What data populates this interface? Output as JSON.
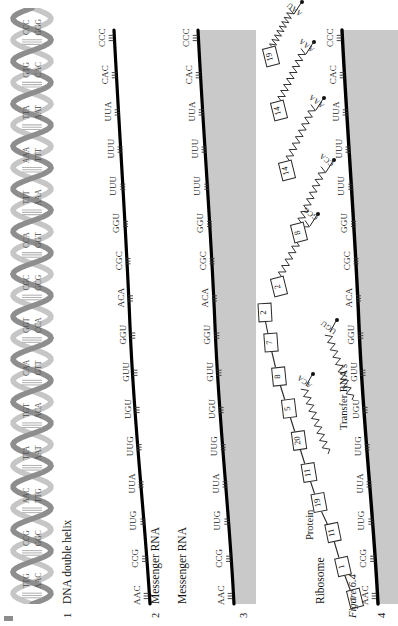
{
  "figure": {
    "caption": "Figure 6.4",
    "sections": [
      {
        "number": "1",
        "title": "DNA double helix"
      },
      {
        "number": "2",
        "title": "Messenger RNA"
      },
      {
        "number": "3",
        "title": "Messenger RNA"
      },
      {
        "number": "4",
        "title": "Ribosome"
      }
    ],
    "protein_label": "Protein",
    "trna_label": "Transfer RNA's"
  },
  "dna": {
    "top_strand": [
      "TTG",
      "CCG",
      "AAC",
      "TTA",
      "TGT",
      "CAA",
      "GGT",
      "CGC",
      "CCA",
      "TTT",
      "AAA",
      "TTA",
      "GTG",
      "CCC"
    ],
    "bottom_strand": [
      "AAC",
      "GGC",
      "TTG",
      "AAT",
      "ACA",
      "GTT",
      "CCA",
      "GCG",
      "GGT",
      "AAA",
      "TTT",
      "AAT",
      "CAC",
      "GGG"
    ],
    "helix_color_front": "#8e8e8e",
    "helix_color_back": "#c6c6c6",
    "rung_color": "#b5b5b5"
  },
  "mrna": {
    "codons": [
      "AAC",
      "CCG",
      "UUG",
      "UUA",
      "UUG",
      "UGU",
      "GUU",
      "GGU",
      "ACA",
      "CGC",
      "GGU",
      "UUU",
      "UUU",
      "UUA",
      "CAC",
      "CCC"
    ],
    "strand_color": "#000000"
  },
  "ribosome": {
    "codons": [
      "AAC",
      "CCG",
      "UUG",
      "UUA",
      "UUG",
      "UGU",
      "GUU",
      "GGU",
      "ACA",
      "CGC",
      "GGU",
      "UUU",
      "UUU",
      "UUA",
      "CAC",
      "CCC"
    ],
    "band_color": "#c9c9c9",
    "strand_color": "#000000"
  },
  "protein_chain": [
    {
      "residue": "7"
    },
    {
      "residue": "1"
    },
    {
      "residue": "11"
    },
    {
      "residue": "19"
    },
    {
      "residue": "11"
    },
    {
      "residue": "20"
    },
    {
      "residue": "5"
    },
    {
      "residue": "8"
    },
    {
      "residue": "7"
    },
    {
      "residue": "2"
    }
  ],
  "trnas": [
    {
      "residue": "2",
      "anticodon": "GCG"
    },
    {
      "residue": "8",
      "anticodon": "CCA"
    },
    {
      "residue": "14",
      "anticodon": "AAA"
    },
    {
      "residue": "14",
      "anticodon": "AAA"
    },
    {
      "residue": "19",
      "anticodon": "AAU"
    }
  ],
  "free_trnas": [
    {
      "anticodon": "ACA"
    },
    {
      "anticodon": "UGU"
    }
  ]
}
